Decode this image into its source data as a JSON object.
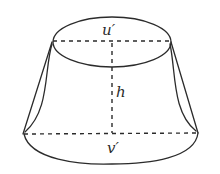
{
  "figure": {
    "labels": {
      "top_diameter": "u′",
      "height": "h",
      "bottom_diameter": "v′"
    },
    "colors": {
      "line": "#2b2b2b",
      "background": "#ffffff"
    }
  }
}
